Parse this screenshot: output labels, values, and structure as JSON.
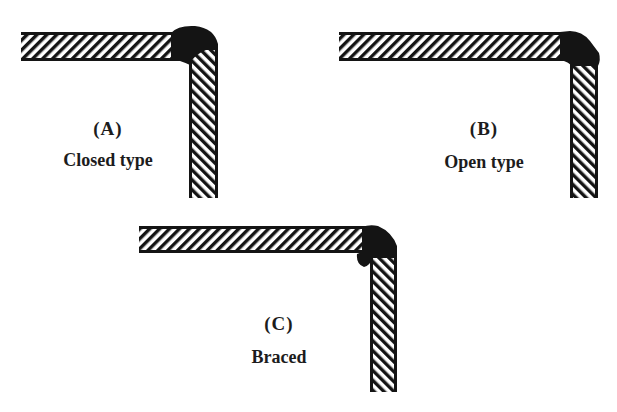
{
  "figure": {
    "colors": {
      "ink": "#141414",
      "background": "#ffffff"
    }
  },
  "joints": [
    {
      "id": "A",
      "letter": "(A)",
      "caption": "Closed type",
      "horizontal_bar": {
        "x": 21,
        "y": 32,
        "w": 168,
        "h": 28
      },
      "vertical_bar": {
        "x": 189,
        "y": 46,
        "w": 29,
        "h": 152
      },
      "weld": "closed"
    },
    {
      "id": "B",
      "letter": "(B)",
      "caption": "Open type",
      "horizontal_bar": {
        "x": 339,
        "y": 32,
        "w": 230,
        "h": 28
      },
      "vertical_bar": {
        "x": 570,
        "y": 63,
        "w": 28,
        "h": 135
      },
      "weld": "open"
    },
    {
      "id": "C",
      "letter": "(C)",
      "caption": "Braced",
      "horizontal_bar": {
        "x": 139,
        "y": 226,
        "w": 228,
        "h": 26
      },
      "vertical_bar": {
        "x": 370,
        "y": 256,
        "w": 27,
        "h": 136
      },
      "weld": "braced"
    }
  ]
}
